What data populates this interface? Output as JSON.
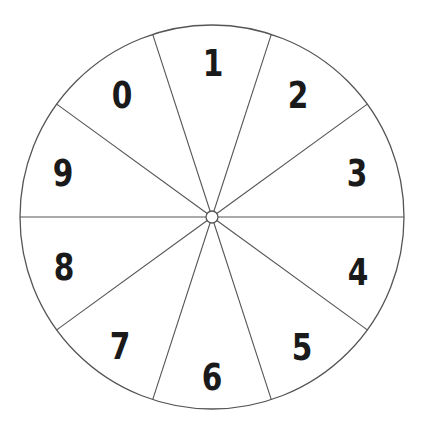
{
  "diagram": {
    "type": "number-wheel",
    "center": [
      212,
      217
    ],
    "radius": 192,
    "hub_radius": 6,
    "stroke_color": "#555555",
    "digit_color": "#1a1a1a",
    "background": "#ffffff",
    "boundary_angles_deg": [
      0,
      36,
      72,
      108,
      144,
      180,
      216,
      252,
      288,
      324
    ],
    "sectors": [
      {
        "label": "1",
        "pos": [
          213,
          63
        ]
      },
      {
        "label": "2",
        "pos": [
          298,
          95
        ]
      },
      {
        "label": "3",
        "pos": [
          357,
          173
        ]
      },
      {
        "label": "4",
        "pos": [
          358,
          272
        ]
      },
      {
        "label": "5",
        "pos": [
          302,
          347
        ]
      },
      {
        "label": "6",
        "pos": [
          212,
          377
        ]
      },
      {
        "label": "7",
        "pos": [
          120,
          346
        ]
      },
      {
        "label": "8",
        "pos": [
          64,
          267
        ]
      },
      {
        "label": "9",
        "pos": [
          63,
          173
        ]
      },
      {
        "label": "0",
        "pos": [
          122,
          95
        ]
      }
    ]
  }
}
